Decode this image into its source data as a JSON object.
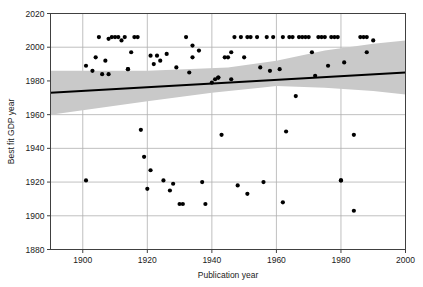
{
  "chart_data": {
    "type": "scatter",
    "title": "",
    "xlabel": "Publication year",
    "ylabel": "Best fit GDP year",
    "xlim": [
      1890,
      2000
    ],
    "ylim": [
      1880,
      2020
    ],
    "xticks": [
      1900,
      1920,
      1940,
      1960,
      1980,
      2000
    ],
    "yticks": [
      1880,
      1900,
      1920,
      1940,
      1960,
      1980,
      2000,
      2020
    ],
    "grid": true,
    "legend": "none",
    "colors": {
      "point": "#000000",
      "line": "#000000",
      "band": "#c9c9c9",
      "grid": "#b0b0b0",
      "axis": "#404040",
      "background": "#ffffff"
    },
    "series": [
      {
        "name": "Best fit GDP year vs publication year",
        "marker": "filled-circle",
        "points": [
          [
            1901,
            1989
          ],
          [
            1901,
            1921
          ],
          [
            1903,
            1986
          ],
          [
            1904,
            1994
          ],
          [
            1905,
            2006
          ],
          [
            1906,
            1984
          ],
          [
            1907,
            1992
          ],
          [
            1908,
            1984
          ],
          [
            1908,
            2005
          ],
          [
            1909,
            2006
          ],
          [
            1910,
            2006
          ],
          [
            1911,
            2006
          ],
          [
            1912,
            2004
          ],
          [
            1913,
            2006
          ],
          [
            1914,
            1987
          ],
          [
            1914,
            1987
          ],
          [
            1915,
            1997
          ],
          [
            1916,
            2006
          ],
          [
            1917,
            2006
          ],
          [
            1918,
            1951
          ],
          [
            1919,
            1935
          ],
          [
            1920,
            1916
          ],
          [
            1921,
            1927
          ],
          [
            1921,
            1995
          ],
          [
            1922,
            1990
          ],
          [
            1923,
            1995
          ],
          [
            1924,
            1992
          ],
          [
            1925,
            1921
          ],
          [
            1926,
            1996
          ],
          [
            1927,
            1915
          ],
          [
            1928,
            1919
          ],
          [
            1929,
            1988
          ],
          [
            1930,
            1907
          ],
          [
            1931,
            1907
          ],
          [
            1932,
            2006
          ],
          [
            1933,
            1985
          ],
          [
            1934,
            1994
          ],
          [
            1934,
            2001
          ],
          [
            1936,
            1998
          ],
          [
            1937,
            1920
          ],
          [
            1938,
            1907
          ],
          [
            1940,
            1979
          ],
          [
            1941,
            1981
          ],
          [
            1942,
            1982
          ],
          [
            1942,
            1982
          ],
          [
            1943,
            1948
          ],
          [
            1944,
            1994
          ],
          [
            1945,
            1994
          ],
          [
            1946,
            1997
          ],
          [
            1946,
            1981
          ],
          [
            1947,
            2006
          ],
          [
            1948,
            1918
          ],
          [
            1949,
            2006
          ],
          [
            1950,
            1994
          ],
          [
            1951,
            1913
          ],
          [
            1951,
            2006
          ],
          [
            1952,
            2006
          ],
          [
            1954,
            2006
          ],
          [
            1955,
            1988
          ],
          [
            1956,
            1920
          ],
          [
            1957,
            2006
          ],
          [
            1958,
            1986
          ],
          [
            1959,
            2006
          ],
          [
            1961,
            1987
          ],
          [
            1962,
            1908
          ],
          [
            1962,
            2006
          ],
          [
            1963,
            1950
          ],
          [
            1964,
            2006
          ],
          [
            1965,
            2006
          ],
          [
            1966,
            1971
          ],
          [
            1967,
            2006
          ],
          [
            1968,
            2006
          ],
          [
            1969,
            2006
          ],
          [
            1970,
            2006
          ],
          [
            1971,
            1997
          ],
          [
            1972,
            1983
          ],
          [
            1973,
            2006
          ],
          [
            1974,
            2006
          ],
          [
            1975,
            2006
          ],
          [
            1976,
            1989
          ],
          [
            1977,
            2006
          ],
          [
            1978,
            2006
          ],
          [
            1979,
            2006
          ],
          [
            1980,
            1921
          ],
          [
            1980,
            1921
          ],
          [
            1981,
            1991
          ],
          [
            1984,
            1903
          ],
          [
            1984,
            1948
          ],
          [
            1986,
            2006
          ],
          [
            1987,
            2006
          ],
          [
            1988,
            2006
          ],
          [
            1988,
            1997
          ],
          [
            1990,
            2004
          ]
        ]
      }
    ],
    "regression_line": {
      "name": "linear fit",
      "x_start": 1890,
      "y_start": 1973,
      "x_end": 2000,
      "y_end": 1985,
      "color": "#000000",
      "width": 2.2
    },
    "confidence_band": {
      "name": "confidence interval",
      "color": "#c9c9c9",
      "upper": [
        [
          1890,
          1986
        ],
        [
          1920,
          1986
        ],
        [
          1945,
          1988
        ],
        [
          1960,
          1992
        ],
        [
          1975,
          1998
        ],
        [
          1990,
          2002
        ],
        [
          2000,
          2004
        ]
      ],
      "lower": [
        [
          1890,
          1960
        ],
        [
          1905,
          1964
        ],
        [
          1920,
          1968
        ],
        [
          1940,
          1973
        ],
        [
          1955,
          1976
        ],
        [
          1960,
          1977
        ],
        [
          1975,
          1976
        ],
        [
          1990,
          1974
        ],
        [
          2000,
          1972
        ]
      ]
    }
  }
}
